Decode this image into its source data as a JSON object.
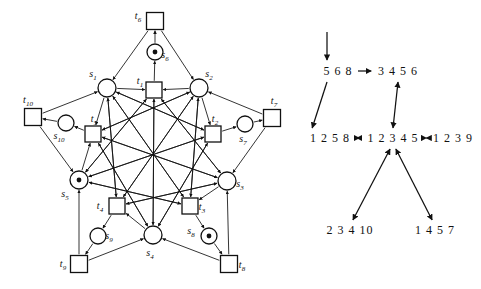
{
  "figure": {
    "colors": {
      "ink": "#111111",
      "background": "#ffffff"
    }
  },
  "petri_net": {
    "places": [
      {
        "id": "s1",
        "label": "s",
        "sub": "1",
        "cx": 107,
        "cy": 88,
        "r": 9,
        "tokens": 0
      },
      {
        "id": "s2",
        "label": "s",
        "sub": "2",
        "cx": 199,
        "cy": 88,
        "r": 9,
        "tokens": 0
      },
      {
        "id": "s3",
        "label": "s",
        "sub": "3",
        "cx": 227,
        "cy": 181,
        "r": 9,
        "tokens": 0
      },
      {
        "id": "s4",
        "label": "s",
        "sub": "4",
        "cx": 153,
        "cy": 235,
        "r": 9,
        "tokens": 0
      },
      {
        "id": "s5",
        "label": "s",
        "sub": "5",
        "cx": 79,
        "cy": 180,
        "r": 9,
        "tokens": 1
      },
      {
        "id": "s6",
        "label": "s",
        "sub": "6",
        "cx": 155,
        "cy": 52,
        "r": 8,
        "tokens": 1
      },
      {
        "id": "s7",
        "label": "s",
        "sub": "7",
        "cx": 245,
        "cy": 124,
        "r": 8,
        "tokens": 0
      },
      {
        "id": "s8",
        "label": "s",
        "sub": "8",
        "cx": 209,
        "cy": 236,
        "r": 8,
        "tokens": 1
      },
      {
        "id": "s9",
        "label": "s",
        "sub": "9",
        "cx": 98,
        "cy": 236,
        "r": 8,
        "tokens": 0
      },
      {
        "id": "s10",
        "label": "s",
        "sub": "10",
        "cx": 66,
        "cy": 123,
        "r": 8,
        "tokens": 0
      }
    ],
    "transitions": [
      {
        "id": "t1",
        "label": "t",
        "sub": "1",
        "cx": 154,
        "cy": 90,
        "w": 16,
        "h": 16
      },
      {
        "id": "t2",
        "label": "t",
        "sub": "2",
        "cx": 213,
        "cy": 134,
        "w": 16,
        "h": 16
      },
      {
        "id": "t3",
        "label": "t",
        "sub": "3",
        "cx": 190,
        "cy": 206,
        "w": 16,
        "h": 16
      },
      {
        "id": "t4",
        "label": "t",
        "sub": "4",
        "cx": 117,
        "cy": 206,
        "w": 16,
        "h": 16
      },
      {
        "id": "t5",
        "label": "t",
        "sub": "5",
        "cx": 93,
        "cy": 134,
        "w": 16,
        "h": 16
      },
      {
        "id": "t6",
        "label": "t",
        "sub": "6",
        "cx": 155,
        "cy": 21,
        "w": 17,
        "h": 17
      },
      {
        "id": "t7",
        "label": "t",
        "sub": "7",
        "cx": 272,
        "cy": 118,
        "w": 17,
        "h": 17
      },
      {
        "id": "t8",
        "label": "t",
        "sub": "8",
        "cx": 229,
        "cy": 264,
        "w": 17,
        "h": 17
      },
      {
        "id": "t9",
        "label": "t",
        "sub": "9",
        "cx": 79,
        "cy": 264,
        "w": 17,
        "h": 17
      },
      {
        "id": "t10",
        "label": "t",
        "sub": "10",
        "cx": 33,
        "cy": 117,
        "w": 17,
        "h": 17
      }
    ],
    "label_offsets": {
      "s1": {
        "dx": -14,
        "dy": -11
      },
      "s2": {
        "dx": 10,
        "dy": -11
      },
      "s3": {
        "dx": 13,
        "dy": 6
      },
      "s4": {
        "dx": -3,
        "dy": 21
      },
      "s5": {
        "dx": -14,
        "dy": 17
      },
      "s6": {
        "dx": 10,
        "dy": 6
      },
      "s7": {
        "dx": -2,
        "dy": 18
      },
      "s8": {
        "dx": -18,
        "dy": -2
      },
      "s9": {
        "dx": 11,
        "dy": 3
      },
      "s10": {
        "dx": -7,
        "dy": 16
      },
      "t1": {
        "dx": -14,
        "dy": -6
      },
      "t2": {
        "dx": 2,
        "dy": -12
      },
      "t3": {
        "dx": 12,
        "dy": 4
      },
      "t4": {
        "dx": -17,
        "dy": 3
      },
      "t5": {
        "dx": 1,
        "dy": -12
      },
      "t6": {
        "dx": -17,
        "dy": -2
      },
      "t7": {
        "dx": 2,
        "dy": -14
      },
      "t8": {
        "dx": 13,
        "dy": 4
      },
      "t9": {
        "dx": -16,
        "dy": 3
      },
      "t10": {
        "dx": -5,
        "dy": -14
      }
    },
    "arcs": [
      [
        "s6",
        "t6"
      ],
      [
        "t6",
        "s1"
      ],
      [
        "t6",
        "s2"
      ],
      [
        "t1",
        "s6"
      ],
      [
        "s1",
        "t1"
      ],
      [
        "s2",
        "t1"
      ],
      [
        "s1",
        "t5"
      ],
      [
        "s2",
        "t2"
      ],
      [
        "s3",
        "t3"
      ],
      [
        "s4",
        "t4"
      ],
      [
        "s5",
        "t5"
      ],
      [
        "t1",
        "s3"
      ],
      [
        "t1",
        "s4"
      ],
      [
        "t1",
        "s5"
      ],
      [
        "t2",
        "s1"
      ],
      [
        "t2",
        "s4"
      ],
      [
        "t2",
        "s5"
      ],
      [
        "t3",
        "s1"
      ],
      [
        "t3",
        "s2"
      ],
      [
        "t3",
        "s5"
      ],
      [
        "t4",
        "s1"
      ],
      [
        "t4",
        "s2"
      ],
      [
        "t4",
        "s3"
      ],
      [
        "t5",
        "s2"
      ],
      [
        "t5",
        "s3"
      ],
      [
        "t5",
        "s4"
      ],
      [
        "s3",
        "t1"
      ],
      [
        "s4",
        "t1"
      ],
      [
        "s5",
        "t1"
      ],
      [
        "s1",
        "t2"
      ],
      [
        "s4",
        "t2"
      ],
      [
        "s5",
        "t2"
      ],
      [
        "s1",
        "t3"
      ],
      [
        "s2",
        "t3"
      ],
      [
        "s5",
        "t3"
      ],
      [
        "s1",
        "t4"
      ],
      [
        "s2",
        "t4"
      ],
      [
        "s3",
        "t4"
      ],
      [
        "s2",
        "t5"
      ],
      [
        "s3",
        "t5"
      ],
      [
        "s4",
        "t5"
      ],
      [
        "s10",
        "t10"
      ],
      [
        "t10",
        "s1"
      ],
      [
        "t10",
        "s5"
      ],
      [
        "t5",
        "s10"
      ],
      [
        "s7",
        "t7"
      ],
      [
        "t7",
        "s2"
      ],
      [
        "t7",
        "s3"
      ],
      [
        "t2",
        "s7"
      ],
      [
        "s8",
        "t8"
      ],
      [
        "t8",
        "s3"
      ],
      [
        "t8",
        "s4"
      ],
      [
        "t3",
        "s8"
      ],
      [
        "s9",
        "t9"
      ],
      [
        "t9",
        "s4"
      ],
      [
        "t9",
        "s5"
      ],
      [
        "t4",
        "s9"
      ]
    ]
  },
  "reachability_graph": {
    "nodes": [
      {
        "id": "n568",
        "text": "5 6 8",
        "x": 338,
        "y": 75
      },
      {
        "id": "n3456",
        "text": "3 4 5 6",
        "x": 398,
        "y": 75
      },
      {
        "id": "n1258",
        "text": "1 2 5 8",
        "x": 330,
        "y": 142
      },
      {
        "id": "n12345",
        "text": "1 2 3 4 5",
        "x": 393,
        "y": 142
      },
      {
        "id": "n1239",
        "text": "1 2 3 9",
        "x": 453,
        "y": 142
      },
      {
        "id": "n23410",
        "text": "2 3 4 10",
        "x": 350,
        "y": 234
      },
      {
        "id": "n1457",
        "text": "1 4 5 7",
        "x": 435,
        "y": 234
      }
    ],
    "edges": [
      {
        "from": "start",
        "to": "n568",
        "type": "single"
      },
      {
        "from": "n568",
        "to": "n3456",
        "type": "single"
      },
      {
        "from": "n568",
        "to": "n1258",
        "type": "single"
      },
      {
        "from": "n3456",
        "to": "n12345",
        "type": "double"
      },
      {
        "from": "n1258",
        "to": "n12345",
        "type": "double"
      },
      {
        "from": "n12345",
        "to": "n1239",
        "type": "double"
      },
      {
        "from": "n12345",
        "to": "n23410",
        "type": "double"
      },
      {
        "from": "n12345",
        "to": "n1457",
        "type": "double"
      }
    ]
  }
}
